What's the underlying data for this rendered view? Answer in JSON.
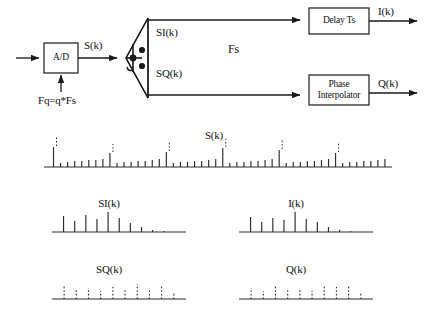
{
  "diagram": {
    "blocks": {
      "adc": {
        "label": "A/D",
        "name": "analog-to-digital-converter"
      },
      "splitter": {
        "label": "",
        "name": "iq-splitter-mixer",
        "icon": "mixer-icon"
      },
      "delay": {
        "label": "Delay Ts",
        "name": "delay-block"
      },
      "phase": {
        "line1": "Phase",
        "line2": "Interpolator",
        "name": "phase-interpolator-block"
      }
    },
    "signals": {
      "adc_clock": "Fq=q*Fs",
      "adc_out": "S(k)",
      "branch_rate": "Fs",
      "si": "SI(k)",
      "sq": "SQ(k)",
      "i_out": "I(k)",
      "q_out": "Q(k)"
    },
    "colors": {
      "stroke": "#1a1a1a",
      "background": "#ffffff",
      "impulse": "#2a2a2a",
      "axis": "#2a2a2a"
    }
  },
  "chart_data": [
    {
      "type": "bar",
      "name": "plot-sk",
      "title": "S(k)",
      "xlabel": "",
      "ylabel": "",
      "grid": false,
      "legend": "none",
      "note": "Oversampled quantizer output at Fq = q*Fs: tall solid impulses every 8th sample mark the Fs instants, with dotted markers above them; short solid ticks are the intermediate q-rate samples.",
      "x": [
        0,
        1,
        2,
        3,
        4,
        5,
        6,
        7,
        8,
        9,
        10,
        11,
        12,
        13,
        14,
        15,
        16,
        17,
        18,
        19,
        20,
        21,
        22,
        23,
        24,
        25,
        26,
        27,
        28,
        29,
        30,
        31,
        32,
        33,
        34,
        35,
        36,
        37,
        38,
        39,
        40,
        41,
        42,
        43,
        44,
        45,
        46,
        47
      ],
      "values": [
        20,
        4,
        5,
        6,
        6,
        7,
        7,
        8,
        14,
        4,
        5,
        5,
        6,
        6,
        7,
        8,
        15,
        4,
        5,
        5,
        6,
        6,
        7,
        8,
        19,
        4,
        5,
        5,
        6,
        6,
        7,
        8,
        17,
        4,
        5,
        5,
        6,
        6,
        7,
        8,
        14,
        4,
        5,
        5,
        6,
        6,
        7,
        8
      ],
      "dotted_overlay_at": [
        0,
        8,
        16,
        24,
        32,
        40
      ],
      "dotted_overlay_height": [
        9,
        8,
        9,
        8,
        9,
        9
      ],
      "ylim": [
        0,
        26
      ]
    },
    {
      "type": "bar",
      "name": "plot-sik",
      "title": "SI(k)",
      "xlabel": "",
      "ylabel": "",
      "grid": false,
      "legend": "none",
      "note": "In-phase sample train after decimation to Fs; solid impulses with a central peak that tapers to the right.",
      "x": [
        0,
        1,
        2,
        3,
        4,
        5,
        6,
        7,
        8,
        9,
        10
      ],
      "values": [
        16,
        11,
        17,
        13,
        20,
        14,
        9,
        5,
        2,
        1,
        0
      ],
      "ylim": [
        0,
        24
      ]
    },
    {
      "type": "bar",
      "name": "plot-ik",
      "title": "I(k)",
      "xlabel": "",
      "ylabel": "",
      "grid": false,
      "legend": "none",
      "note": "In-phase output after Delay Ts; same envelope as SI(k), shifted one sample later.",
      "x": [
        0,
        1,
        2,
        3,
        4,
        5,
        6,
        7,
        8,
        9,
        10
      ],
      "values": [
        15,
        10,
        14,
        12,
        20,
        13,
        10,
        5,
        2,
        1,
        0
      ],
      "ylim": [
        0,
        24
      ]
    },
    {
      "type": "bar",
      "name": "plot-sqk",
      "title": "SQ(k)",
      "xlabel": "",
      "ylabel": "",
      "grid": false,
      "legend": "none",
      "note": "Quadrature sample train drawn with dotted impulses, indicating samples that fall between the in-phase instants.",
      "style": "dotted",
      "x": [
        0,
        1,
        2,
        3,
        4,
        5,
        6,
        7,
        8,
        9
      ],
      "values": [
        13,
        9,
        11,
        8,
        12,
        9,
        15,
        11,
        14,
        6
      ],
      "ylim": [
        0,
        20
      ]
    },
    {
      "type": "bar",
      "name": "plot-qk",
      "title": "Q(k)",
      "xlabel": "",
      "ylabel": "",
      "grid": false,
      "legend": "none",
      "note": "Quadrature output after the phase interpolator, drawn with dotted impulses.",
      "style": "dotted",
      "x": [
        0,
        1,
        2,
        3,
        4,
        5,
        6,
        7,
        8,
        9
      ],
      "values": [
        11,
        8,
        13,
        9,
        10,
        8,
        14,
        12,
        13,
        7
      ],
      "ylim": [
        0,
        20
      ]
    }
  ]
}
